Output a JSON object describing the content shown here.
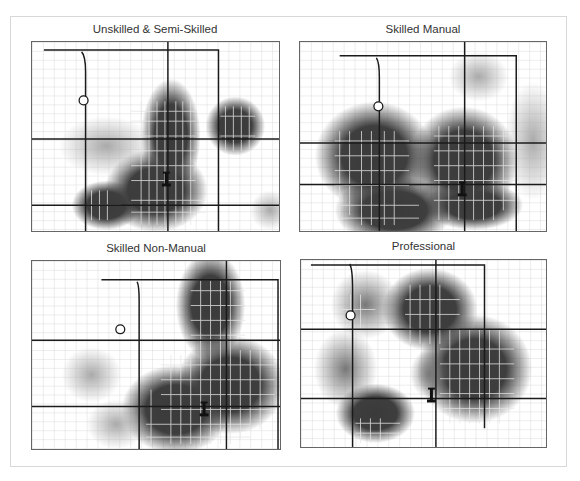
{
  "figure": {
    "panels": [
      {
        "id": "unskilled",
        "title": "Unskilled & Semi-Skilled"
      },
      {
        "id": "skilled-manual",
        "title": "Skilled Manual"
      },
      {
        "id": "skilled-non-manual",
        "title": "Skilled Non-Manual"
      },
      {
        "id": "professional",
        "title": "Professional"
      }
    ],
    "legend_markers": {
      "circle": "circle-marker-icon",
      "landmark": "landmark-marker-icon"
    },
    "colors": {
      "density_core": "#3a3a3a",
      "density_edge": "#ffffff",
      "major_road": "#1a1a1a",
      "minor_street": "#cfcfcf",
      "frame_border": "#d8d8d8"
    }
  }
}
